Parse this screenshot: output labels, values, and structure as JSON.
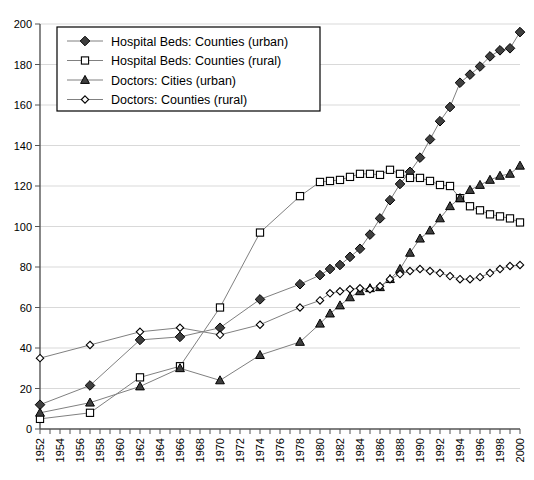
{
  "chart_data": {
    "type": "line",
    "title": "",
    "xlabel": "",
    "ylabel": "",
    "ylim": [
      0,
      200
    ],
    "ytick_step": 20,
    "yticks": [
      0,
      20,
      40,
      60,
      80,
      100,
      120,
      140,
      160,
      180,
      200
    ],
    "xlim": [
      1952,
      2000
    ],
    "xticks_all_years": true,
    "xtick_labels": [
      "1952",
      "1954",
      "1956",
      "1958",
      "1960",
      "1962",
      "1964",
      "1966",
      "1968",
      "1970",
      "1972",
      "1974",
      "1976",
      "1978",
      "1980",
      "1982",
      "1984",
      "1986",
      "1988",
      "1990",
      "1992",
      "1994",
      "1996",
      "1998",
      "2000"
    ],
    "grid": "horizontal",
    "legend_position": "top-left",
    "series": [
      {
        "name": "Hospital Beds: Counties (urban)",
        "marker": "filled-diamond",
        "x": [
          1952,
          1957,
          1962,
          1966,
          1970,
          1974,
          1978,
          1980,
          1981,
          1982,
          1983,
          1984,
          1985,
          1986,
          1987,
          1988,
          1989,
          1990,
          1991,
          1992,
          1993,
          1994,
          1995,
          1996,
          1997,
          1998,
          1999,
          2000
        ],
        "values": [
          12,
          21.5,
          44,
          45.5,
          50,
          64,
          71.5,
          76,
          79,
          81,
          85,
          89,
          96,
          104,
          113,
          121,
          127,
          134,
          143,
          152,
          159,
          171,
          175,
          179,
          184,
          187,
          188,
          196
        ]
      },
      {
        "name": "Hospital Beds: Counties (rural)",
        "marker": "open-square",
        "x": [
          1952,
          1957,
          1962,
          1966,
          1970,
          1974,
          1978,
          1980,
          1981,
          1982,
          1983,
          1984,
          1985,
          1986,
          1987,
          1988,
          1989,
          1990,
          1991,
          1992,
          1993,
          1994,
          1995,
          1996,
          1997,
          1998,
          1999,
          2000
        ],
        "values": [
          5,
          8,
          25.5,
          31,
          60,
          97,
          115,
          122,
          122.5,
          123,
          124.5,
          126,
          126,
          125.5,
          128,
          126,
          124,
          124,
          122.5,
          120.5,
          120,
          114,
          110,
          108,
          106,
          105,
          104,
          102
        ]
      },
      {
        "name": "Doctors: Cities (urban)",
        "marker": "filled-triangle",
        "x": [
          1952,
          1957,
          1962,
          1966,
          1970,
          1974,
          1978,
          1980,
          1981,
          1982,
          1983,
          1984,
          1985,
          1986,
          1987,
          1988,
          1989,
          1990,
          1991,
          1992,
          1993,
          1994,
          1995,
          1996,
          1997,
          1998,
          1999,
          2000
        ],
        "values": [
          8,
          13,
          21,
          30,
          24,
          36.5,
          43,
          52,
          57,
          61,
          65,
          68,
          69.5,
          70,
          74,
          79,
          87,
          94,
          98,
          104,
          110,
          114,
          118,
          120.5,
          123,
          125,
          126,
          130
        ]
      },
      {
        "name": "Doctors: Counties (rural)",
        "marker": "open-diamond",
        "x": [
          1952,
          1957,
          1962,
          1966,
          1970,
          1974,
          1978,
          1980,
          1981,
          1982,
          1983,
          1984,
          1985,
          1986,
          1987,
          1988,
          1989,
          1990,
          1991,
          1992,
          1993,
          1994,
          1995,
          1996,
          1997,
          1998,
          1999,
          2000
        ],
        "values": [
          35,
          41.5,
          48,
          50,
          46.5,
          51.5,
          60,
          63.5,
          67,
          68,
          69,
          69.5,
          69,
          70.5,
          74,
          76.5,
          78,
          79,
          78,
          77,
          75.5,
          74,
          74,
          75,
          77,
          79,
          80.5,
          81
        ]
      }
    ]
  },
  "legend": {
    "items": [
      {
        "label": "Hospital Beds: Counties (urban)"
      },
      {
        "label": "Hospital Beds: Counties (rural)"
      },
      {
        "label": "Doctors: Cities (urban)"
      },
      {
        "label": "Doctors: Counties (rural)"
      }
    ]
  }
}
